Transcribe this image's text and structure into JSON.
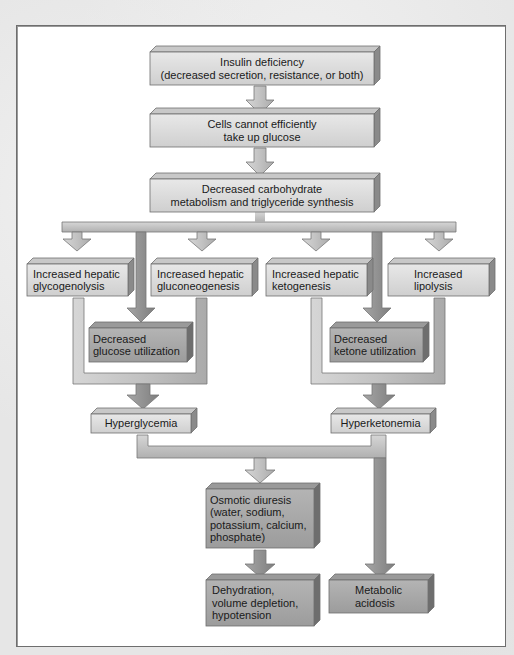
{
  "figure": {
    "colors": {
      "light_box": "#dcdcdc",
      "dark_box": "#a8a8a8",
      "connector": "#b9b9b9",
      "dark_connector": "#8e8e8e",
      "border": "#6e6e6e",
      "text": "#1a1a1a"
    }
  },
  "nodes": {
    "insulin_deficiency": {
      "line1": "Insulin deficiency",
      "line2": "(decreased secretion, resistance, or both)"
    },
    "cells_cannot": {
      "line1": "Cells cannot efficiently",
      "line2": "take up glucose"
    },
    "decreased_carb": {
      "line1": "Decreased carbohydrate",
      "line2": "metabolism and triglyceride synthesis"
    },
    "glycogenolysis": {
      "line1": "Increased hepatic",
      "line2": "glycogenolysis"
    },
    "gluconeogenesis": {
      "line1": "Increased hepatic",
      "line2": "gluconeogenesis"
    },
    "ketogenesis": {
      "line1": "Increased hepatic",
      "line2": "ketogenesis"
    },
    "lipolysis": {
      "line1": "Increased",
      "line2": "lipolysis"
    },
    "decreased_glucose_util": {
      "line1": "Decreased",
      "line2": "glucose utilization"
    },
    "decreased_ketone_util": {
      "line1": "Decreased",
      "line2": "ketone utilization"
    },
    "hyperglycemia": {
      "line1": "Hyperglycemia"
    },
    "hyperketonemia": {
      "line1": "Hyperketonemia"
    },
    "osmotic_diuresis": {
      "line1": "Osmotic diuresis",
      "line2": "(water, sodium,",
      "line3": "potassium, calcium,",
      "line4": "phosphate)"
    },
    "dehydration": {
      "line1": "Dehydration,",
      "line2": "volume depletion,",
      "line3": "hypotension"
    },
    "metabolic_acidosis": {
      "line1": "Metabolic",
      "line2": "acidosis"
    }
  },
  "edges": [
    [
      "insulin_deficiency",
      "cells_cannot"
    ],
    [
      "cells_cannot",
      "decreased_carb"
    ],
    [
      "decreased_carb",
      "glycogenolysis"
    ],
    [
      "decreased_carb",
      "gluconeogenesis"
    ],
    [
      "decreased_carb",
      "ketogenesis"
    ],
    [
      "decreased_carb",
      "lipolysis"
    ],
    [
      "decreased_carb",
      "decreased_glucose_util"
    ],
    [
      "decreased_carb",
      "decreased_ketone_util"
    ],
    [
      "glycogenolysis",
      "hyperglycemia"
    ],
    [
      "gluconeogenesis",
      "hyperglycemia"
    ],
    [
      "decreased_glucose_util",
      "hyperglycemia"
    ],
    [
      "ketogenesis",
      "hyperketonemia"
    ],
    [
      "lipolysis",
      "hyperketonemia"
    ],
    [
      "decreased_ketone_util",
      "hyperketonemia"
    ],
    [
      "hyperglycemia",
      "osmotic_diuresis"
    ],
    [
      "hyperketonemia",
      "osmotic_diuresis"
    ],
    [
      "hyperketonemia",
      "metabolic_acidosis"
    ],
    [
      "osmotic_diuresis",
      "dehydration"
    ]
  ]
}
